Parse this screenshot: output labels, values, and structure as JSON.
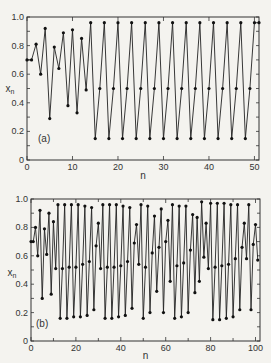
{
  "chart_data": [
    {
      "type": "line",
      "panel_label": "(a)",
      "xlabel": "n",
      "ylabel": "x_n",
      "xlim": [
        0,
        51
      ],
      "ylim": [
        0,
        1.0
      ],
      "xticks": [
        "0",
        "10",
        "20",
        "30",
        "40",
        "50"
      ],
      "yticks": [
        "0",
        "0.2",
        "0.4",
        "0.6",
        "0.8",
        "1.0"
      ],
      "markers": true,
      "series": [
        {
          "name": "x_n",
          "x": [
            0,
            1,
            2,
            3,
            4,
            5,
            6,
            7,
            8,
            9,
            10,
            11,
            12,
            13,
            14,
            15,
            16,
            17,
            18,
            19,
            20,
            21,
            22,
            23,
            24,
            25,
            26,
            27,
            28,
            29,
            30,
            31,
            32,
            33,
            34,
            35,
            36,
            37,
            38,
            39,
            40,
            41,
            42,
            43,
            44,
            45,
            46,
            47,
            48,
            49,
            50,
            51
          ],
          "values": [
            0.7,
            0.7,
            0.81,
            0.6,
            0.92,
            0.29,
            0.79,
            0.64,
            0.89,
            0.38,
            0.91,
            0.33,
            0.85,
            0.49,
            0.96,
            0.15,
            0.5,
            0.96,
            0.15,
            0.5,
            0.96,
            0.15,
            0.5,
            0.96,
            0.15,
            0.5,
            0.96,
            0.15,
            0.5,
            0.96,
            0.15,
            0.5,
            0.96,
            0.15,
            0.5,
            0.96,
            0.15,
            0.5,
            0.96,
            0.15,
            0.5,
            0.96,
            0.15,
            0.5,
            0.96,
            0.15,
            0.5,
            0.96,
            0.15,
            0.5,
            0.96,
            0.96
          ]
        }
      ]
    },
    {
      "type": "line",
      "panel_label": "(b)",
      "xlabel": "n",
      "ylabel": "x_n",
      "xlim": [
        0,
        102
      ],
      "ylim": [
        0,
        1.0
      ],
      "xticks": [
        "0",
        "20",
        "40",
        "60",
        "80",
        "100"
      ],
      "yticks": [
        "0",
        "0.2",
        "0.4",
        "0.6",
        "0.8",
        "1.0"
      ],
      "markers": true,
      "series": [
        {
          "name": "x_n",
          "x": [
            0,
            1,
            2,
            3,
            4,
            5,
            6,
            7,
            8,
            9,
            10,
            11,
            12,
            13,
            14,
            15,
            16,
            17,
            18,
            19,
            20,
            21,
            22,
            23,
            24,
            25,
            26,
            27,
            28,
            29,
            30,
            31,
            32,
            33,
            34,
            35,
            36,
            37,
            38,
            39,
            40,
            41,
            42,
            43,
            44,
            45,
            46,
            47,
            48,
            49,
            50,
            51,
            52,
            53,
            54,
            55,
            56,
            57,
            58,
            59,
            60,
            61,
            62,
            63,
            64,
            65,
            66,
            67,
            68,
            69,
            70,
            71,
            72,
            73,
            74,
            75,
            76,
            77,
            78,
            79,
            80,
            81,
            82,
            83,
            84,
            85,
            86,
            87,
            88,
            89,
            90,
            91,
            92,
            93,
            94,
            95,
            96,
            97,
            98,
            99,
            100,
            101
          ],
          "values": [
            0.7,
            0.7,
            0.8,
            0.6,
            0.92,
            0.3,
            0.79,
            0.61,
            0.9,
            0.33,
            0.84,
            0.51,
            0.96,
            0.16,
            0.51,
            0.96,
            0.16,
            0.52,
            0.96,
            0.17,
            0.52,
            0.96,
            0.17,
            0.54,
            0.95,
            0.18,
            0.56,
            0.94,
            0.22,
            0.67,
            0.83,
            0.51,
            0.96,
            0.16,
            0.52,
            0.96,
            0.16,
            0.52,
            0.96,
            0.17,
            0.53,
            0.95,
            0.18,
            0.56,
            0.94,
            0.23,
            0.69,
            0.82,
            0.54,
            0.96,
            0.16,
            0.52,
            0.95,
            0.2,
            0.62,
            0.88,
            0.35,
            0.66,
            0.93,
            0.2,
            0.7,
            0.85,
            0.42,
            0.96,
            0.16,
            0.53,
            0.95,
            0.17,
            0.55,
            0.95,
            0.2,
            0.64,
            0.89,
            0.34,
            0.87,
            0.42,
            0.98,
            0.59,
            0.83,
            0.51,
            0.97,
            0.15,
            0.52,
            0.97,
            0.15,
            0.53,
            0.97,
            0.16,
            0.54,
            0.96,
            0.17,
            0.58,
            0.96,
            0.22,
            0.66,
            0.83,
            0.58,
            0.96,
            0.22,
            0.68,
            0.82,
            0.57
          ]
        }
      ]
    }
  ]
}
